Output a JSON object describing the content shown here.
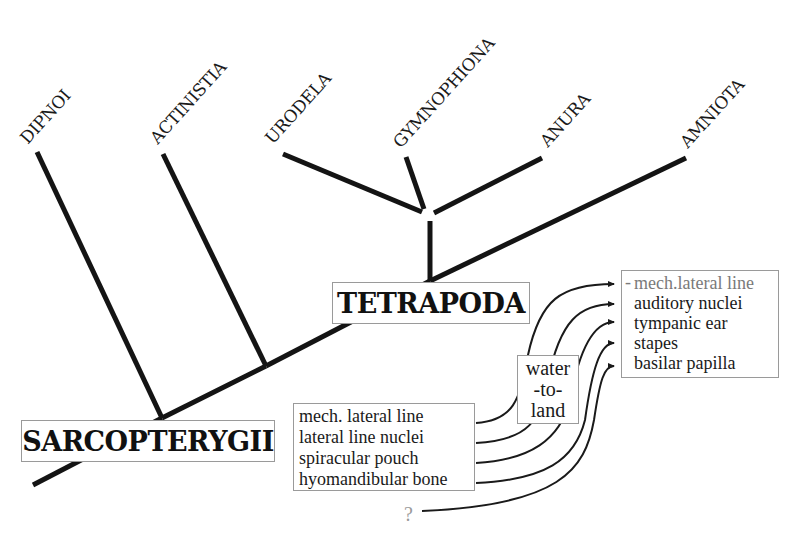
{
  "taxa": [
    {
      "id": "dipnoi",
      "label": "DIPNOI"
    },
    {
      "id": "actinistia",
      "label": "ACTINISTIA"
    },
    {
      "id": "urodela",
      "label": "URODELA"
    },
    {
      "id": "gymnophiona",
      "label": "GYMNOPHIONA"
    },
    {
      "id": "anura",
      "label": "ANURA"
    },
    {
      "id": "amniota",
      "label": "AMNIOTA"
    }
  ],
  "clades": {
    "root": "SARCOPTERYGII",
    "tetrapods": "TETRAPODA"
  },
  "fish_features": {
    "items": [
      "mech. lateral line",
      "lateral line nuclei",
      "spiracular pouch",
      "hyomandibular bone"
    ],
    "unknown": "?"
  },
  "transition": {
    "lines": [
      "water",
      "-to-",
      "land"
    ]
  },
  "tetrapod_features": {
    "dash": "-",
    "items": [
      "mech.lateral line",
      "auditory nuclei",
      "tympanic ear",
      "stapes",
      "basilar papilla"
    ]
  },
  "mappings": [
    {
      "from": "mech. lateral line",
      "to": "mech.lateral line"
    },
    {
      "from": "lateral line nuclei",
      "to": "auditory nuclei"
    },
    {
      "from": "spiracular pouch",
      "to": "tympanic ear"
    },
    {
      "from": "hyomandibular bone",
      "to": "stapes"
    },
    {
      "from": "?",
      "to": "basilar papilla"
    }
  ]
}
